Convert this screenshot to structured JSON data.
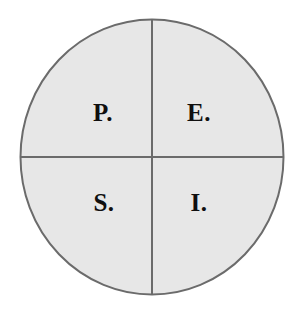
{
  "diagram": {
    "type": "quadrant-circle",
    "shape": "circle",
    "divisions": 4,
    "colors": {
      "background": "#ffffff",
      "fill": "#e7e7e7",
      "stroke": "#6b6b6b",
      "text": "#100f0f"
    },
    "geometry": {
      "center_x": 152,
      "center_y": 157,
      "radius_x": 132,
      "radius_y": 138,
      "stroke_width": 2
    },
    "quadrants": [
      {
        "position": "top-left",
        "label": "P."
      },
      {
        "position": "top-right",
        "label": "E."
      },
      {
        "position": "bottom-left",
        "label": "S."
      },
      {
        "position": "bottom-right",
        "label": "I."
      }
    ]
  }
}
